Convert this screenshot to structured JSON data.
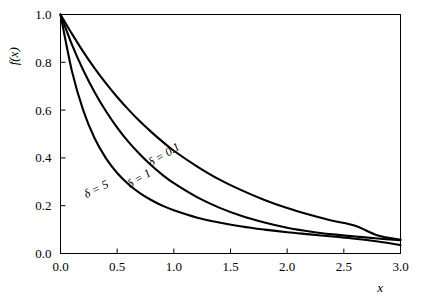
{
  "chart_data": {
    "type": "line",
    "title": "",
    "subtitle": "",
    "xlabel": "x",
    "ylabel": "f(x)",
    "xlim": [
      0.0,
      3.0
    ],
    "ylim": [
      0.0,
      1.0
    ],
    "grid": false,
    "legend_position": "inline-curve-labels",
    "background_color": "#ffffff",
    "line_color": "#000000",
    "axis_color": "#000000",
    "xticks": [
      "0.0",
      "0.5",
      "1.0",
      "1.5",
      "2.0",
      "2.5",
      "3.0"
    ],
    "xtick_values": [
      0.0,
      0.5,
      1.0,
      1.5,
      2.0,
      2.5,
      3.0
    ],
    "yticks": [
      "0.0",
      "0.2",
      "0.4",
      "0.6",
      "0.8",
      "1.0"
    ],
    "ytick_values": [
      0.0,
      0.2,
      0.4,
      0.6,
      0.8,
      1.0
    ],
    "x": [
      0.0,
      0.1,
      0.2,
      0.3,
      0.4,
      0.5,
      0.6,
      0.7,
      0.8,
      0.9,
      1.0,
      1.2,
      1.4,
      1.6,
      1.8,
      2.0,
      2.2,
      2.4,
      2.6,
      2.8,
      3.0
    ],
    "series": [
      {
        "name": "delta = 0.1",
        "label": "δ = 0.1",
        "label_x": 0.93,
        "label_y": 0.4,
        "label_rotation": -31,
        "values": [
          1.0,
          0.92,
          0.845,
          0.776,
          0.713,
          0.655,
          0.602,
          0.553,
          0.509,
          0.468,
          0.43,
          0.366,
          0.31,
          0.264,
          0.224,
          0.19,
          0.162,
          0.137,
          0.116,
          0.075,
          0.058
        ]
      },
      {
        "name": "delta = 1",
        "label": "δ = 1",
        "label_x": 0.71,
        "label_y": 0.3,
        "label_rotation": -31,
        "values": [
          1.0,
          0.875,
          0.768,
          0.676,
          0.596,
          0.527,
          0.467,
          0.415,
          0.369,
          0.329,
          0.294,
          0.237,
          0.192,
          0.157,
          0.13,
          0.108,
          0.092,
          0.08,
          0.071,
          0.063,
          0.056
        ]
      },
      {
        "name": "delta = 5",
        "label": "δ = 5",
        "label_x": 0.33,
        "label_y": 0.255,
        "label_rotation": -26,
        "values": [
          1.0,
          0.765,
          0.6,
          0.483,
          0.399,
          0.337,
          0.29,
          0.253,
          0.224,
          0.2,
          0.181,
          0.151,
          0.13,
          0.113,
          0.1,
          0.089,
          0.08,
          0.071,
          0.062,
          0.05,
          0.035
        ]
      }
    ]
  },
  "axes": {
    "x_label": "x",
    "y_label": "f(x)"
  }
}
